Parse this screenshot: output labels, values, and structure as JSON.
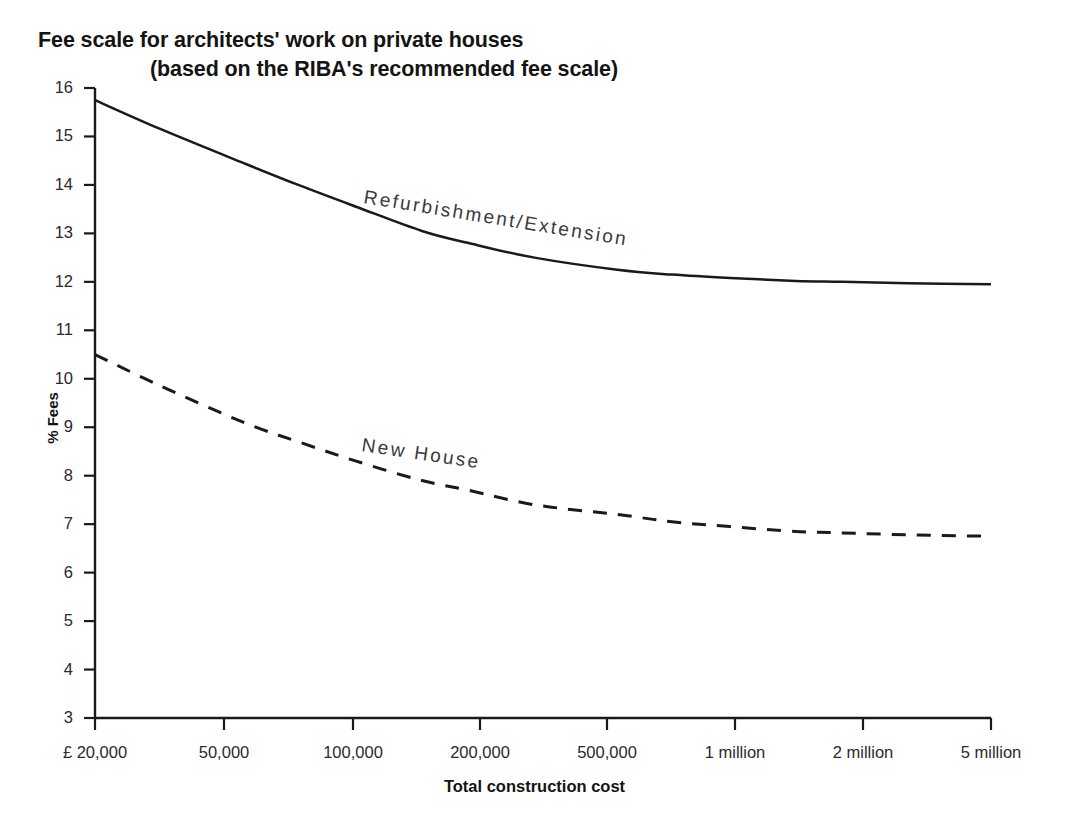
{
  "chart_data": {
    "type": "line",
    "title": "Fee scale for architects' work on private houses",
    "subtitle": "(based on the RIBA's recommended fee scale)",
    "xlabel": "Total construction cost",
    "ylabel": "% Fees",
    "xscale": "log",
    "xlim": [
      20000,
      5000000
    ],
    "ylim": [
      3,
      16
    ],
    "grid": false,
    "legend": "inline-labels",
    "xtick_labels": [
      "£ 20,000",
      "50,000",
      "100,000",
      "200,000",
      "500,000",
      "1 million",
      "2 million",
      "5 million"
    ],
    "xtick_values": [
      20000,
      50000,
      100000,
      200000,
      500000,
      1000000,
      2000000,
      5000000
    ],
    "ytick_labels": [
      "3",
      "4",
      "5",
      "6",
      "7",
      "8",
      "9",
      "10",
      "11",
      "12",
      "13",
      "14",
      "15",
      "16"
    ],
    "ytick_values": [
      3,
      4,
      5,
      6,
      7,
      8,
      9,
      10,
      11,
      12,
      13,
      14,
      15,
      16
    ],
    "series": [
      {
        "name": "Refurbishment/Extension",
        "style": "solid",
        "color": "#1a1a1a",
        "x": [
          20000,
          30000,
          50000,
          70000,
          100000,
          150000,
          200000,
          300000,
          500000,
          700000,
          1000000,
          1500000,
          2000000,
          3000000,
          5000000
        ],
        "values": [
          15.75,
          15.15,
          14.45,
          14.0,
          13.55,
          13.05,
          12.8,
          12.5,
          12.25,
          12.15,
          12.08,
          12.02,
          12.0,
          11.97,
          11.95
        ]
      },
      {
        "name": "New House",
        "style": "dashed",
        "color": "#1a1a1a",
        "x": [
          20000,
          30000,
          50000,
          70000,
          100000,
          150000,
          200000,
          300000,
          500000,
          700000,
          1000000,
          1500000,
          2000000,
          3000000,
          5000000
        ],
        "values": [
          10.5,
          9.85,
          9.1,
          8.7,
          8.3,
          7.9,
          7.7,
          7.4,
          7.2,
          7.05,
          6.95,
          6.85,
          6.82,
          6.78,
          6.75
        ]
      }
    ]
  },
  "axis": {
    "x_tick_positions_px": [
      95,
      224,
      353,
      480,
      607,
      735,
      863,
      991
    ],
    "y_top_px": 88,
    "y_bottom_px": 718
  }
}
